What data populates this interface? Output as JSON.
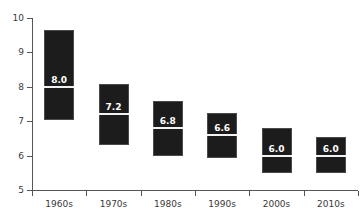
{
  "chart_data": {
    "type": "box",
    "title": "",
    "xlabel": "",
    "ylabel": "",
    "ylim": [
      5,
      10
    ],
    "ytick_labels": [
      "10",
      "9",
      "8",
      "7",
      "6",
      "5"
    ],
    "ytick_values": [
      10,
      9,
      8,
      7,
      6,
      5
    ],
    "grid": false,
    "legend": "none",
    "categories": [
      "1960s",
      "1970s",
      "1980s",
      "1990s",
      "2000s",
      "2010s"
    ],
    "boxes": [
      {
        "category": "1960s",
        "q1": 7.03,
        "median": 8.0,
        "q3": 9.65,
        "median_label": "8.0"
      },
      {
        "category": "1970s",
        "q1": 6.31,
        "median": 7.2,
        "q3": 8.08,
        "median_label": "7.2"
      },
      {
        "category": "1980s",
        "q1": 6.0,
        "median": 6.8,
        "q3": 7.6,
        "median_label": "6.8"
      },
      {
        "category": "1990s",
        "q1": 5.93,
        "median": 6.6,
        "q3": 7.24,
        "median_label": "6.6"
      },
      {
        "category": "2000s",
        "q1": 5.5,
        "median": 6.0,
        "q3": 6.8,
        "median_label": "6.0"
      },
      {
        "category": "2010s",
        "q1": 5.5,
        "median": 6.0,
        "q3": 6.55,
        "median_label": "6.0"
      }
    ],
    "colors": {
      "box_fill": "#1c1c1c",
      "box_edge": "#4a4a4a",
      "median_line": "#f2f2f2",
      "median_text": "#ffffff",
      "axis": "#555555",
      "tick_text": "#3a3a3a",
      "background": "#ffffff"
    }
  }
}
